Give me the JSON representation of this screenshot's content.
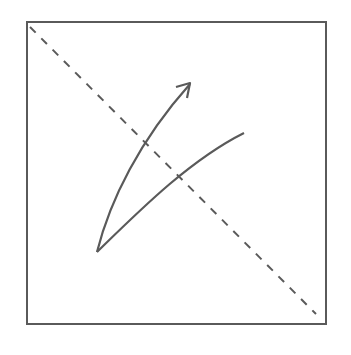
{
  "diagram": {
    "frame": {
      "x": 27,
      "y": 22,
      "width": 299,
      "height": 302
    },
    "stroke_color": "#5a5a5a",
    "diagonal": {
      "x1": 30,
      "y1": 27,
      "x2": 316,
      "y2": 314,
      "style": "dashed"
    },
    "arrow_curve": {
      "start": [
        97,
        252
      ],
      "end": [
        190,
        83
      ],
      "has_arrowhead": true
    },
    "plain_curve": {
      "start": [
        97,
        252
      ],
      "end": [
        244,
        133
      ],
      "has_arrowhead": false
    }
  }
}
